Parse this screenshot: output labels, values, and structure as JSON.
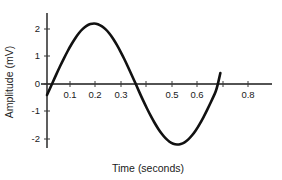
{
  "chart_data": {
    "type": "line",
    "title": "",
    "subtitle": "",
    "xlabel": "Time (seconds)",
    "ylabel": "Amplitude (mV)",
    "xlim": [
      -0.035,
      0.88
    ],
    "ylim": [
      -2.6,
      2.6
    ],
    "grid": false,
    "legend": null,
    "x_ticks": [
      0.1,
      0.2,
      0.3,
      0.4,
      0.5,
      0.6,
      0.7,
      0.8
    ],
    "x_tick_labels": [
      "0.1",
      "0.2",
      "0.3",
      "",
      "0.5",
      "0.6",
      "",
      "0.8"
    ],
    "x_tick_labels_hidden_note": "ticks at 0.4 and 0.7 are drawn but their labels are occluded by the curve",
    "y_ticks": [
      -2,
      -1,
      0,
      1,
      2
    ],
    "y_tick_labels": [
      "-2",
      "-1",
      "0",
      "1",
      "2"
    ],
    "series": [
      {
        "name": "signal",
        "color": "#111111",
        "amplitude": 2.2,
        "period": 0.67,
        "phase_at_t0": -0.4,
        "x": [
          0.0,
          0.015,
          0.03,
          0.045,
          0.06,
          0.075,
          0.09,
          0.105,
          0.12,
          0.135,
          0.15,
          0.165,
          0.18,
          0.195,
          0.21,
          0.225,
          0.24,
          0.255,
          0.27,
          0.285,
          0.3,
          0.315,
          0.33,
          0.345,
          0.36,
          0.375,
          0.39,
          0.405,
          0.42,
          0.435,
          0.45,
          0.465,
          0.48,
          0.495,
          0.51,
          0.525,
          0.54,
          0.555,
          0.57,
          0.585,
          0.6,
          0.615,
          0.63,
          0.645,
          0.66,
          0.675,
          0.69
        ],
        "y": [
          -0.4,
          -0.1,
          0.21,
          0.51,
          0.8,
          1.07,
          1.33,
          1.56,
          1.77,
          1.94,
          2.07,
          2.16,
          2.2,
          2.2,
          2.15,
          2.06,
          1.93,
          1.76,
          1.55,
          1.31,
          1.05,
          0.77,
          0.47,
          0.17,
          -0.14,
          -0.45,
          -0.74,
          -1.02,
          -1.28,
          -1.52,
          -1.73,
          -1.91,
          -2.05,
          -2.15,
          -2.2,
          -2.2,
          -2.16,
          -2.08,
          -1.95,
          -1.78,
          -1.58,
          -1.34,
          -1.08,
          -0.8,
          -0.51,
          -0.21,
          0.4
        ]
      }
    ]
  },
  "figure": {
    "background_color": "#ffffff",
    "axis_color": "#1a1a1a",
    "curve_color": "#111111"
  }
}
